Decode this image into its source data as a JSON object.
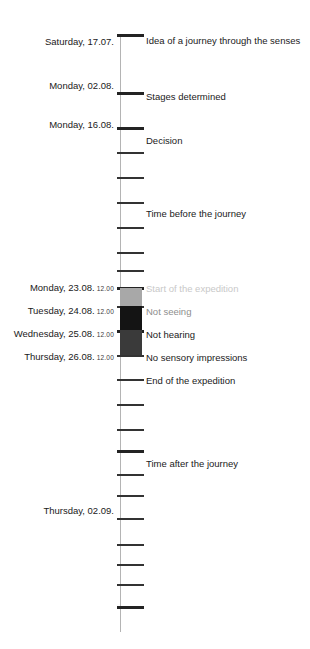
{
  "diagram": {
    "orientation": "vertical",
    "axis": {
      "color": "#b4b4b4",
      "top": 34,
      "bottom": 632
    }
  },
  "palette": {
    "axis": "#b4b4b4",
    "tick": "#6e6e6e",
    "tick_major": "#333333",
    "tick_heavy": "#232323",
    "text": "#1a1a1a",
    "block_light": "#a8a8a8",
    "block_black": "#141414",
    "block_dark": "#3a3a3a",
    "label_faint": "#c9c9c9",
    "label_mid": "#8e8e8e",
    "label_dark": "#4a4a4a"
  },
  "dates": [
    {
      "text": "Saturday, 17.07.",
      "time": "",
      "y": 36
    },
    {
      "text": "Monday, 02.08.",
      "time": "",
      "y": 80
    },
    {
      "text": "Monday, 16.08.",
      "time": "",
      "y": 119
    },
    {
      "text": "Monday, 23.08.",
      "time": "12.00",
      "y": 282
    },
    {
      "text": "Tuesday, 24.08.",
      "time": "12.00",
      "y": 305
    },
    {
      "text": "Wednesday, 25.08.",
      "time": "12.00",
      "y": 328
    },
    {
      "text": "Thursday, 26.08.",
      "time": "12.00",
      "y": 351
    },
    {
      "text": "Thursday, 02.09.",
      "time": "",
      "y": 505
    }
  ],
  "events": [
    {
      "text": "Idea of a journey through the senses",
      "y": 35,
      "tone": "dark"
    },
    {
      "text": "Stages determined",
      "y": 91,
      "tone": "dark"
    },
    {
      "text": "Decision",
      "y": 135,
      "tone": "dark"
    },
    {
      "text": "Time before the journey",
      "y": 208,
      "tone": "dark"
    },
    {
      "text": "Start of the expedition",
      "y": 283,
      "tone": "faint"
    },
    {
      "text": "Not seeing",
      "y": 306,
      "tone": "mid"
    },
    {
      "text": "Not hearing",
      "y": 329,
      "tone": "dark"
    },
    {
      "text": "No sensory impressions",
      "y": 352,
      "tone": "dark"
    },
    {
      "text": "End of the expedition",
      "y": 375,
      "tone": "dark"
    },
    {
      "text": "Time after the journey",
      "y": 458,
      "tone": "dark"
    }
  ],
  "ticks": [
    {
      "y": 34,
      "weight": "heavy"
    },
    {
      "y": 92,
      "weight": "heavy"
    },
    {
      "y": 127,
      "weight": "heavy"
    },
    {
      "y": 152,
      "weight": "major"
    },
    {
      "y": 177,
      "weight": "major"
    },
    {
      "y": 202,
      "weight": "major"
    },
    {
      "y": 227,
      "weight": "major"
    },
    {
      "y": 252,
      "weight": "major"
    },
    {
      "y": 270,
      "weight": "major"
    },
    {
      "y": 287,
      "weight": "heavy"
    },
    {
      "y": 306,
      "weight": "major"
    },
    {
      "y": 330,
      "weight": "heavy"
    },
    {
      "y": 355,
      "weight": "major"
    },
    {
      "y": 379,
      "weight": "major"
    },
    {
      "y": 404,
      "weight": "major"
    },
    {
      "y": 429,
      "weight": "major"
    },
    {
      "y": 450,
      "weight": "heavy"
    },
    {
      "y": 474,
      "weight": "major"
    },
    {
      "y": 495,
      "weight": "major"
    },
    {
      "y": 518,
      "weight": "major"
    },
    {
      "y": 544,
      "weight": "major"
    },
    {
      "y": 564,
      "weight": "major"
    },
    {
      "y": 584,
      "weight": "major"
    },
    {
      "y": 606,
      "weight": "heavy"
    }
  ],
  "phases": [
    {
      "name": "not-seeing",
      "color": "#a8a8a8",
      "y": 288,
      "height": 18
    },
    {
      "name": "not-hearing",
      "color": "#141414",
      "y": 306,
      "height": 24
    },
    {
      "name": "no-sensory-impressions",
      "color": "#3a3a3a",
      "y": 330,
      "height": 25
    }
  ]
}
